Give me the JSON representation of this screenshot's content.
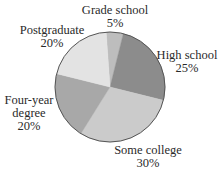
{
  "chart_data": {
    "type": "pie",
    "title": "",
    "start_angle_deg": -4,
    "direction": "clockwise",
    "center": [
      110,
      87
    ],
    "radius": 55,
    "stroke_color": "#555555",
    "categories": [
      "Grade school",
      "High school",
      "Some college",
      "Four-year degree",
      "Postgraduate"
    ],
    "values": [
      5,
      25,
      30,
      20,
      20
    ],
    "unit": "%",
    "slices": [
      {
        "label": "Grade school",
        "value": 5,
        "value_label": "5%",
        "color": "#bdbdbd"
      },
      {
        "label": "High school",
        "value": 25,
        "value_label": "25%",
        "color": "#8c8c8c"
      },
      {
        "label": "Some college",
        "value": 30,
        "value_label": "30%",
        "color": "#cbcbcb"
      },
      {
        "label": "Four-year degree",
        "value": 20,
        "value_label": "20%",
        "color": "#a8a8a8"
      },
      {
        "label": "Postgraduate",
        "value": 20,
        "value_label": "20%",
        "color": "#e3e3e3"
      }
    ],
    "legend": "none (labels placed outside slices)"
  },
  "labels": {
    "grade_school": {
      "line1": "Grade school",
      "line2": "5%"
    },
    "high_school": {
      "line1": "High school",
      "line2": "25%"
    },
    "some_college": {
      "line1": "Some college",
      "line2": "30%"
    },
    "four_year": {
      "line1": "Four-year",
      "line2": "degree",
      "line3": "20%"
    },
    "postgraduate": {
      "line1": "Postgraduate",
      "line2": "20%"
    }
  }
}
